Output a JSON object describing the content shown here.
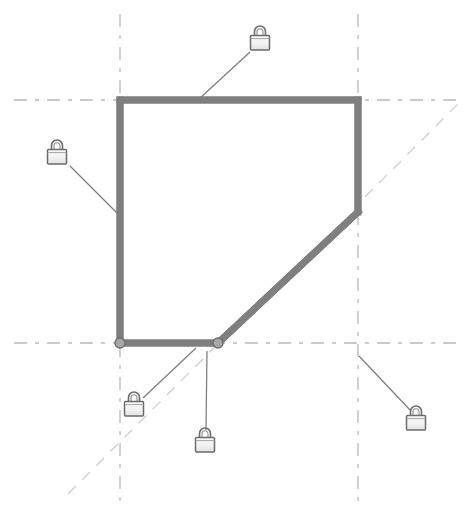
{
  "view": {
    "name": "sketch-constraint-view",
    "width": 474,
    "height": 520,
    "background_color": "#ffffff"
  },
  "colors": {
    "profile_stroke": "#7f7f7f",
    "profile_stroke_dark": "#6e6e6e",
    "construction_line": "#b9b9b9",
    "construction_line_light": "#c9c9c9",
    "leader_line": "#808080",
    "lock_stroke": "#666666",
    "lock_fill": "#efefef",
    "node_stroke": "#6e6e6e",
    "node_fill": "#a8a8a8"
  },
  "geometry": {
    "profile": {
      "name": "closed-profile-polygon",
      "stroke_width": 7,
      "closed": true,
      "points": [
        {
          "id": "v1",
          "x": 120,
          "y": 100,
          "label": "top-left-corner"
        },
        {
          "id": "v2",
          "x": 358,
          "y": 100,
          "label": "top-right-corner"
        },
        {
          "id": "v3",
          "x": 358,
          "y": 212,
          "label": "right-bend-point"
        },
        {
          "id": "v4",
          "x": 218,
          "y": 343,
          "label": "bottom-chamfer-point"
        },
        {
          "id": "v5",
          "x": 120,
          "y": 343,
          "label": "bottom-left-corner"
        }
      ],
      "edges": [
        {
          "id": "e1",
          "from": "v1",
          "to": "v2",
          "type": "horizontal-top-edge"
        },
        {
          "id": "e2",
          "from": "v2",
          "to": "v3",
          "type": "vertical-right-edge"
        },
        {
          "id": "e3",
          "from": "v3",
          "to": "v4",
          "type": "diagonal-chamfer-edge"
        },
        {
          "id": "e4",
          "from": "v4",
          "to": "v5",
          "type": "horizontal-bottom-edge"
        },
        {
          "id": "e5",
          "from": "v5",
          "to": "v1",
          "type": "vertical-left-edge"
        }
      ]
    },
    "nodes": [
      {
        "id": "n1",
        "x": 120,
        "y": 343,
        "r": 5,
        "label": "vertex-node-bottom-left"
      },
      {
        "id": "n2",
        "x": 218,
        "y": 343,
        "r": 5,
        "label": "vertex-node-chamfer"
      }
    ],
    "construction_lines": [
      {
        "id": "c1",
        "type": "horizontal",
        "x1": 14,
        "y1": 100,
        "x2": 462,
        "y2": 100,
        "label": "horizontal-axis-top"
      },
      {
        "id": "c2",
        "type": "horizontal",
        "x1": 14,
        "y1": 343,
        "x2": 462,
        "y2": 343,
        "label": "horizontal-axis-bottom"
      },
      {
        "id": "c3",
        "type": "vertical",
        "x1": 120,
        "y1": 14,
        "x2": 120,
        "y2": 502,
        "label": "vertical-axis-left"
      },
      {
        "id": "c4",
        "type": "vertical",
        "x1": 358,
        "y1": 14,
        "x2": 358,
        "y2": 502,
        "label": "vertical-axis-right"
      },
      {
        "id": "c5",
        "type": "diagonal",
        "x1": 68,
        "y1": 494,
        "x2": 462,
        "y2": 100,
        "label": "diagonal-45-construction"
      }
    ]
  },
  "constraints": [
    {
      "id": "lock-1",
      "name": "lock-constraint-top-edge",
      "icon": "lock-icon",
      "type": "fixed",
      "icon_x": 260,
      "icon_y": 38,
      "leader": {
        "x1": 250,
        "y1": 50,
        "x2": 199,
        "y2": 99
      }
    },
    {
      "id": "lock-2",
      "name": "lock-constraint-left-edge",
      "icon": "lock-icon",
      "type": "fixed",
      "icon_x": 57,
      "icon_y": 152,
      "leader": {
        "x1": 69,
        "y1": 164,
        "x2": 121,
        "y2": 216
      }
    },
    {
      "id": "lock-3",
      "name": "lock-constraint-bottom-left-node",
      "icon": "lock-icon",
      "type": "fixed",
      "icon_x": 134,
      "icon_y": 404,
      "leader": {
        "x1": 142,
        "y1": 396,
        "x2": 195,
        "y2": 349
      }
    },
    {
      "id": "lock-4",
      "name": "lock-constraint-bottom-edge",
      "icon": "lock-icon",
      "type": "fixed",
      "icon_x": 205,
      "icon_y": 440,
      "leader": {
        "x1": 205,
        "y1": 428,
        "x2": 207,
        "y2": 350
      }
    },
    {
      "id": "lock-5",
      "name": "lock-constraint-right-axis",
      "icon": "lock-icon",
      "type": "fixed",
      "icon_x": 416,
      "icon_y": 418,
      "leader": {
        "x1": 408,
        "y1": 408,
        "x2": 359,
        "y2": 356
      }
    },
    {
      "id": "lock-6",
      "name": "lock-constraint-diagonal",
      "icon": "lock-icon",
      "type": "fixed",
      "icon_x": 260,
      "icon_y": 38,
      "leader": null
    }
  ],
  "lock_icon": {
    "name": "lock-icon",
    "width": 22,
    "height": 26,
    "body_width": 20,
    "body_height": 15,
    "shackle_radius": 6,
    "description": "padlock"
  }
}
